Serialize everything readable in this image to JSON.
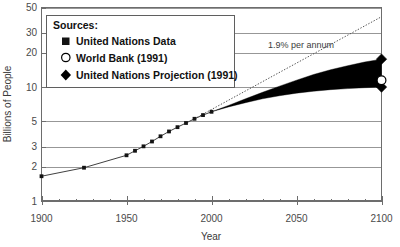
{
  "chart_data": {
    "type": "line",
    "title": "",
    "xlabel": "Year",
    "ylabel": "Billions of People",
    "xlim": [
      1900,
      2100
    ],
    "ylim": [
      1,
      50
    ],
    "yscale": "log",
    "grid": true,
    "xticks": [
      1900,
      1950,
      2000,
      2050,
      2100
    ],
    "xticklabels": [
      "1900",
      "1950",
      "2000",
      "2050",
      "2100"
    ],
    "yticks": [
      1,
      2,
      3,
      5,
      10,
      20,
      30,
      50
    ],
    "yticklabels": [
      "1",
      "2",
      "3",
      "5",
      "10",
      "20",
      "30",
      "50"
    ],
    "legend_position": "top-left",
    "series": [
      {
        "name": "United Nations Data",
        "marker": "square",
        "x": [
          1900,
          1925,
          1950,
          1955,
          1960,
          1965,
          1970,
          1975,
          1980,
          1985,
          1990,
          1995,
          2000
        ],
        "y": [
          1.65,
          1.96,
          2.52,
          2.76,
          3.02,
          3.33,
          3.7,
          4.08,
          4.45,
          4.84,
          5.27,
          5.68,
          6.07
        ]
      },
      {
        "name": "World Bank (1991)",
        "marker": "open-circle",
        "x": [
          2100
        ],
        "y": [
          11.5
        ]
      },
      {
        "name": "United Nations Projection (1991)",
        "marker": "diamond",
        "x": [
          2100,
          2100
        ],
        "y": [
          17.6,
          10.0
        ]
      }
    ],
    "projection_band": {
      "name": "United Nations Projection (1991) range",
      "x": [
        2000,
        2010,
        2020,
        2030,
        2040,
        2050,
        2060,
        2070,
        2080,
        2090,
        2100
      ],
      "high": [
        6.07,
        6.9,
        7.9,
        9.0,
        10.2,
        11.5,
        12.9,
        14.2,
        15.4,
        16.6,
        17.6
      ],
      "low": [
        6.07,
        6.7,
        7.3,
        7.9,
        8.4,
        8.85,
        9.2,
        9.5,
        9.7,
        9.88,
        10.0
      ]
    },
    "annotations": [
      {
        "text": "1.9% per annum",
        "x": 2040,
        "y": 24,
        "kind": "trend-label"
      }
    ],
    "trend_line": {
      "label": "1.9% per annum",
      "rate_percent": 1.9,
      "x": [
        1990,
        2100
      ],
      "y": [
        5.27,
        41.5
      ],
      "style": "dotted"
    }
  },
  "legend": {
    "title": "Sources:",
    "entries": [
      {
        "label": "United Nations Data",
        "marker": "square"
      },
      {
        "label": "World Bank (1991)",
        "marker": "open-circle"
      },
      {
        "label": "United Nations Projection (1991)",
        "marker": "diamond"
      }
    ]
  }
}
